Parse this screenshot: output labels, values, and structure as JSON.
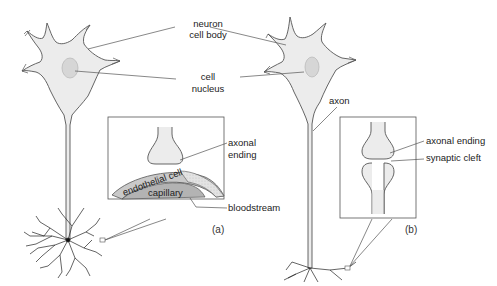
{
  "diagram": {
    "type": "neuron-anatomy",
    "labels": {
      "cell_body_line1": "neuron",
      "cell_body_line2": "cell body",
      "nucleus_line1": "cell",
      "nucleus_line2": "nucleus",
      "axon": "axon"
    },
    "inset_a": {
      "caption": "(a)",
      "axonal_ending_line1": "axonal",
      "axonal_ending_line2": "ending",
      "endothelial_cell": "endothelial cell",
      "capillary": "capillary",
      "bloodstream": "bloodstream"
    },
    "inset_b": {
      "caption": "(b)",
      "axonal_ending": "axonal ending",
      "synaptic_cleft": "synaptic cleft"
    },
    "colors": {
      "cell_fill": "#ececec",
      "nucleus_fill": "#d6d6d6",
      "outline": "#555555",
      "endothelial_fill": "#c9c9c9",
      "capillary_fill": "#b3b3b3"
    }
  }
}
